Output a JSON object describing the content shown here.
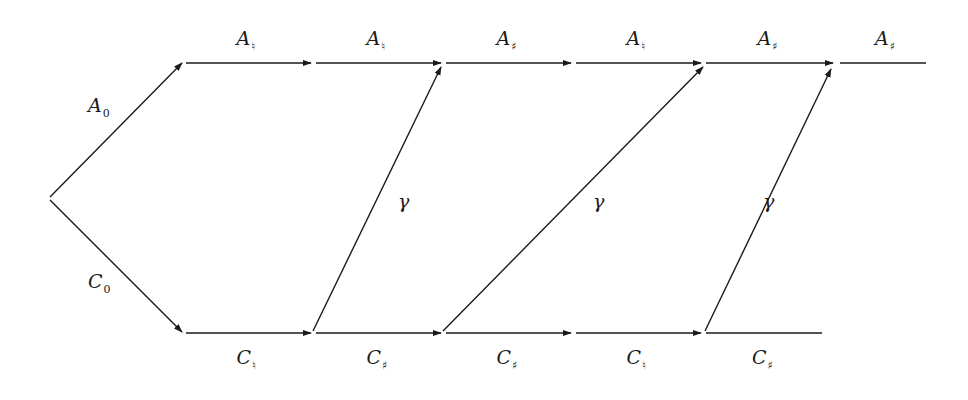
{
  "diagram": {
    "colors": {
      "line": "#1a1a1a",
      "background": "#ffffff"
    },
    "start_edges": [
      {
        "id": "A0",
        "label_main": "A",
        "label_sub": "0",
        "from": [
          50,
          197
        ],
        "to": [
          182,
          63
        ],
        "arrow": true
      },
      {
        "id": "C0",
        "label_main": "C",
        "label_sub": "0",
        "from": [
          50,
          200
        ],
        "to": [
          182,
          332
        ],
        "arrow": true
      }
    ],
    "top_row": {
      "y": 63,
      "edges": [
        {
          "label_main": "A",
          "label_sub": "♮",
          "x1": 186,
          "x2": 311,
          "arrow": true
        },
        {
          "label_main": "A",
          "label_sub": "♮",
          "x1": 316,
          "x2": 441,
          "arrow": true
        },
        {
          "label_main": "A",
          "label_sub": "♯",
          "x1": 446,
          "x2": 571,
          "arrow": true
        },
        {
          "label_main": "A",
          "label_sub": "♮",
          "x1": 576,
          "x2": 701,
          "arrow": true
        },
        {
          "label_main": "A",
          "label_sub": "♯",
          "x1": 706,
          "x2": 833,
          "arrow": true
        },
        {
          "label_main": "A",
          "label_sub": "♯",
          "x1": 840,
          "x2": 926,
          "arrow": false
        }
      ]
    },
    "bottom_row": {
      "y": 333,
      "edges": [
        {
          "label_main": "C",
          "label_sub": "♮",
          "x1": 186,
          "x2": 311,
          "arrow": true
        },
        {
          "label_main": "C",
          "label_sub": "♯",
          "x1": 316,
          "x2": 441,
          "arrow": true
        },
        {
          "label_main": "C",
          "label_sub": "♯",
          "x1": 446,
          "x2": 571,
          "arrow": true
        },
        {
          "label_main": "C",
          "label_sub": "♮",
          "x1": 576,
          "x2": 701,
          "arrow": true
        },
        {
          "label_main": "C",
          "label_sub": "♯",
          "x1": 706,
          "x2": 822,
          "arrow": false
        }
      ]
    },
    "gamma_edges": [
      {
        "label": "γ",
        "from": [
          313,
          331
        ],
        "to": [
          441,
          67
        ]
      },
      {
        "label": "γ",
        "from": [
          443,
          331
        ],
        "to": [
          703,
          67
        ]
      },
      {
        "label": "γ",
        "from": [
          705,
          331
        ],
        "to": [
          831,
          69
        ]
      }
    ]
  }
}
